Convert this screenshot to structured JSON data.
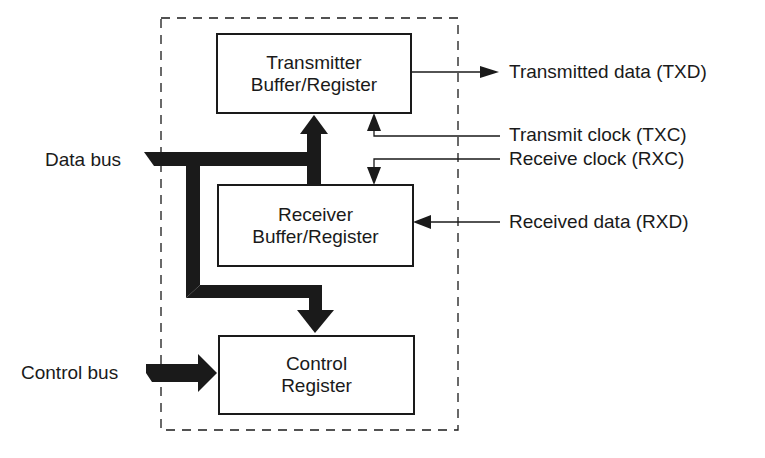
{
  "diagram": {
    "type": "block-diagram",
    "blocks": {
      "transmitter": {
        "line1": "Transmitter",
        "line2": "Buffer/Register"
      },
      "receiver": {
        "line1": "Receiver",
        "line2": "Buffer/Register"
      },
      "control": {
        "line1": "Control",
        "line2": "Register"
      }
    },
    "signals": {
      "txd": "Transmitted data (TXD)",
      "txc": "Transmit clock (TXC)",
      "rxc": "Receive clock (RXC)",
      "rxd": "Received data (RXD)"
    },
    "buses": {
      "data_bus": "Data bus",
      "control_bus": "Control bus"
    },
    "colors": {
      "ink": "#1a1a1a",
      "background": "#ffffff"
    }
  }
}
